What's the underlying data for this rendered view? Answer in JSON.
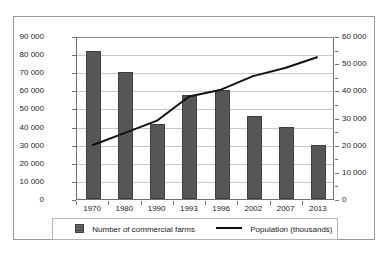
{
  "chart_data": {
    "type": "bar",
    "title": "",
    "subtitle": "",
    "xlabel": "",
    "ylabel": "",
    "grid": true,
    "legend_position": "bottom",
    "categories": [
      "1970",
      "1980",
      "1990",
      "1993",
      "1996",
      "2002",
      "2007",
      "2013"
    ],
    "series": [
      {
        "name": "Number of commercial farms",
        "type": "bar",
        "axis": "left",
        "color": "#565656",
        "values": [
          82000,
          70000,
          41500,
          57500,
          60000,
          46000,
          40000,
          30000
        ]
      },
      {
        "name": "Population (thousands)",
        "type": "line",
        "axis": "right",
        "color": "#111111",
        "values": [
          20000,
          24500,
          29000,
          38000,
          40500,
          45500,
          48500,
          52500
        ]
      }
    ],
    "left_axis": {
      "min": 0,
      "max": 90000,
      "tick_step": 10000,
      "tick_labels": [
        "0",
        "10 000",
        "20 000",
        "30 000",
        "40 000",
        "50 000",
        "60 000",
        "70 000",
        "80 000",
        "90 000"
      ]
    },
    "right_axis": {
      "min": 0,
      "max": 60000,
      "tick_step": 10000,
      "minor_tick_step": 5000,
      "tick_labels": [
        "0",
        "10 000",
        "20 000",
        "30 000",
        "40 000",
        "50 000",
        "60 000"
      ]
    }
  },
  "legend": {
    "bars_label": "Number of commercial farms",
    "line_label": "Population (thousands)"
  },
  "colors": {
    "bar_fill": "#565656",
    "bar_edge": "#3f3f3f",
    "line": "#111111",
    "gridline": "#c8c8c8",
    "frame": "#9a9a9a",
    "axis": "#6e6e6e",
    "text": "#1a1a1a",
    "background": "#ffffff"
  }
}
